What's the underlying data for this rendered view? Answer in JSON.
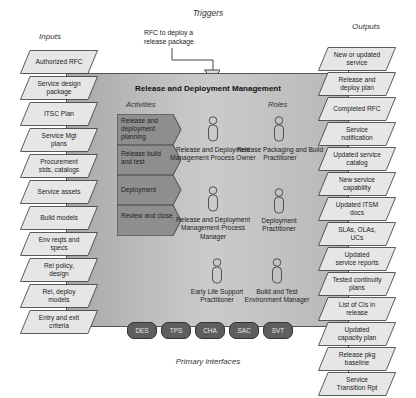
{
  "diagram": {
    "triggers_heading": "Triggers",
    "trigger_text": "RFC to deploy a release package",
    "inputs_heading": "Inputs",
    "outputs_heading": "Outputs",
    "process_title": "Release and Deployment Management",
    "activities_heading": "Activities",
    "roles_heading": "Roles",
    "primary_interfaces_heading": "Primary interfaces",
    "inputs": [
      "Authorized RFC",
      "Service design package",
      "ITSC Plan",
      "Service Mgt plans",
      "Procurement stds, catalogs",
      "Service assets",
      "Build models",
      "Env reqts and specs",
      "Rel policy, design",
      "Rel, deploy models",
      "Entry and exit criteria"
    ],
    "outputs": [
      "New or updated service",
      "Release and deploy plan",
      "Completed RFC",
      "Service notification",
      "Updated service catalog",
      "New service capability",
      "Updated ITSM docs",
      "SLAs, OLAs, UCs",
      "Updated service reports",
      "Tested continuity plans",
      "List of CIs in release",
      "Updated capacity plan",
      "Release pkg baseline",
      "Service Transition Rpt"
    ],
    "activities": [
      "Release and deployment planning",
      "Release build and test",
      "Deployment",
      "Review and close"
    ],
    "roles": [
      "Release and Deployment Management Process Owner",
      "Release Packaging and Build Practitioner",
      "Release and Deployment Management Process Manager",
      "Deployment Practitioner",
      "Early Life Support Practitioner",
      "Build and Test Environment Manager"
    ],
    "interfaces": [
      "DES",
      "TPS",
      "CHA",
      "SAC",
      "SVT"
    ],
    "colors": {
      "panel": "#bcbcbc",
      "activity_fill": "#8e8e8e",
      "parallelogram_fill": "#e6e6e6",
      "interface_pill": "#5e5e5e"
    }
  }
}
